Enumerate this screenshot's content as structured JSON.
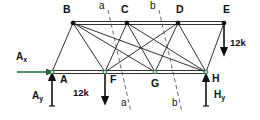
{
  "figure": {
    "background_color": "#ffffff",
    "line_color": "#1a1a1a",
    "reaction_color": "#1d6b3a",
    "section_line_color": "#555555"
  },
  "nodes": [
    {
      "id": "B",
      "label": "B",
      "x": 73,
      "y": 23,
      "label_x": 63,
      "label_y": 8
    },
    {
      "id": "C",
      "label": "C",
      "x": 127,
      "y": 23,
      "label_x": 121,
      "label_y": 8
    },
    {
      "id": "D",
      "label": "D",
      "x": 178,
      "y": 23,
      "label_x": 176,
      "label_y": 8
    },
    {
      "id": "E",
      "label": "E",
      "x": 224,
      "y": 23,
      "label_x": 224,
      "label_y": 8
    },
    {
      "id": "A",
      "label": "A",
      "x": 52,
      "y": 72,
      "label_x": 59,
      "label_y": 76
    },
    {
      "id": "F",
      "label": "F",
      "x": 105,
      "y": 72,
      "label_x": 110,
      "label_y": 76
    },
    {
      "id": "G",
      "label": "G",
      "x": 155,
      "y": 72,
      "label_x": 152,
      "label_y": 78
    },
    {
      "id": "H",
      "label": "H",
      "x": 206,
      "y": 72,
      "label_x": 212,
      "label_y": 75
    }
  ],
  "members": [
    {
      "from": "B",
      "to": "C",
      "name": "member-BC"
    },
    {
      "from": "C",
      "to": "D",
      "name": "member-CD"
    },
    {
      "from": "D",
      "to": "E",
      "name": "member-DE"
    },
    {
      "from": "A",
      "to": "F",
      "name": "member-AF"
    },
    {
      "from": "F",
      "to": "G",
      "name": "member-FG"
    },
    {
      "from": "G",
      "to": "H",
      "name": "member-GH"
    },
    {
      "from": "A",
      "to": "B",
      "name": "member-AB"
    },
    {
      "from": "B",
      "to": "F",
      "name": "member-BF"
    },
    {
      "from": "B",
      "to": "G",
      "name": "member-BG"
    },
    {
      "from": "C",
      "to": "F",
      "name": "member-CF"
    },
    {
      "from": "C",
      "to": "G",
      "name": "member-CG"
    },
    {
      "from": "C",
      "to": "H",
      "name": "member-CH"
    },
    {
      "from": "D",
      "to": "G",
      "name": "member-DG"
    },
    {
      "from": "D",
      "to": "H",
      "name": "member-DH"
    },
    {
      "from": "E",
      "to": "H",
      "name": "member-EH"
    },
    {
      "from": "B",
      "to": "H",
      "name": "member-BH"
    },
    {
      "from": "D",
      "to": "F",
      "name": "member-DF"
    }
  ],
  "forces": [
    {
      "id": "load-F",
      "label": "12k",
      "direction": "down",
      "x": 105,
      "y_start": 74,
      "y_end": 101,
      "label_x": 74,
      "label_y": 92
    },
    {
      "id": "load-E",
      "label": "12k",
      "direction": "down",
      "x": 224,
      "y_start": 25,
      "y_end": 52,
      "label_x": 230,
      "label_y": 42
    }
  ],
  "reactions": [
    {
      "id": "Ax",
      "label": "A",
      "subscript": "x",
      "direction": "right",
      "y": 72,
      "x_start": 17,
      "x_end": 50,
      "label_x": 17,
      "label_y": 55
    },
    {
      "id": "Ay",
      "label": "A",
      "subscript": "y",
      "direction": "up",
      "x": 52,
      "y_start": 106,
      "y_end": 76,
      "label_x": 33,
      "label_y": 95
    },
    {
      "id": "Hy",
      "label": "H",
      "subscript": "y",
      "direction": "up",
      "x": 206,
      "y_start": 106,
      "y_end": 77,
      "label_x": 214,
      "label_y": 94
    }
  ],
  "sections": [
    {
      "id": "section-a",
      "label": "a",
      "x1": 108,
      "y1": 10,
      "x2": 131,
      "y2": 112,
      "top_label_x": 99,
      "top_label_y": 2,
      "bottom_label_x": 122,
      "bottom_label_y": 100
    },
    {
      "id": "section-b",
      "label": "b",
      "x1": 159,
      "y1": 10,
      "x2": 182,
      "y2": 112,
      "top_label_x": 150,
      "top_label_y": 2,
      "bottom_label_x": 173,
      "bottom_label_y": 100
    }
  ]
}
